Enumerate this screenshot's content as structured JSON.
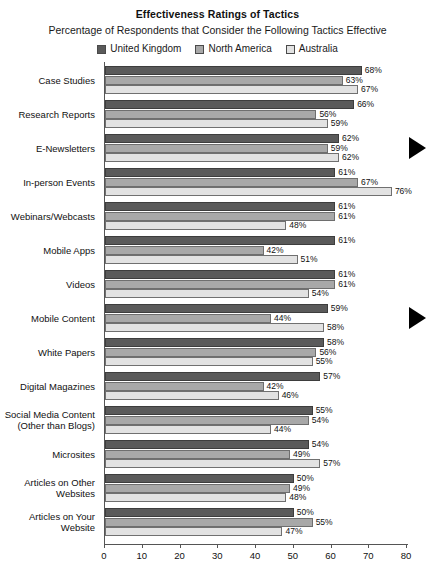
{
  "chart_data": {
    "type": "bar",
    "orientation": "horizontal",
    "title": "Effectiveness Ratings of Tactics",
    "subtitle": "Percentage of Respondents that Consider the Following Tactics Effective",
    "xlabel": "",
    "ylabel": "",
    "xlim": [
      0,
      80
    ],
    "xticks": [
      0,
      10,
      20,
      30,
      40,
      50,
      60,
      70,
      80
    ],
    "grid": false,
    "legend_position": "top-center",
    "value_suffix": "%",
    "categories": [
      "Case Studies",
      "Research Reports",
      "E-Newsletters",
      "In-person Events",
      "Webinars/Webcasts",
      "Mobile Apps",
      "Videos",
      "Mobile Content",
      "White Papers",
      "Digital Magazines",
      "Social Media Content\n(Other than Blogs)",
      "Microsites",
      "Articles on Other\nWebsites",
      "Articles on Your\nWebsite"
    ],
    "series": [
      {
        "name": "United Kingdom",
        "color": "#5a5a5a",
        "values": [
          68,
          66,
          62,
          61,
          61,
          61,
          61,
          59,
          58,
          57,
          55,
          54,
          50,
          50
        ]
      },
      {
        "name": "North America",
        "color": "#a8a8a8",
        "values": [
          63,
          56,
          59,
          67,
          61,
          42,
          61,
          44,
          56,
          42,
          54,
          49,
          49,
          55
        ]
      },
      {
        "name": "Australia",
        "color": "#e2e2e2",
        "values": [
          67,
          59,
          62,
          76,
          48,
          51,
          54,
          58,
          55,
          46,
          44,
          57,
          48,
          47
        ]
      }
    ],
    "annotations": [
      {
        "name": "marker-e-newsletters",
        "icon": "right-triangle-marker",
        "category": "E-Newsletters"
      },
      {
        "name": "marker-mobile-content",
        "icon": "right-triangle-marker",
        "category": "Mobile Content"
      }
    ]
  },
  "source_note": ""
}
